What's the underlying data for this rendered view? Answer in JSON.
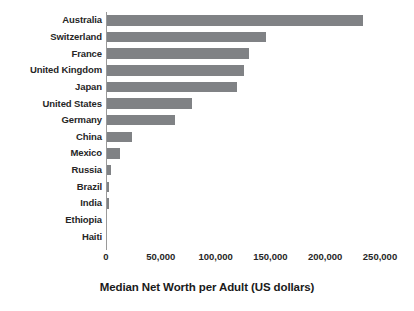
{
  "chart_data": {
    "type": "bar",
    "orientation": "horizontal",
    "title": "",
    "xlabel": "Median Net Worth per Adult (US dollars)",
    "ylabel": "",
    "xlim": [
      0,
      250000
    ],
    "xticks": [
      0,
      50000,
      100000,
      150000,
      200000,
      250000
    ],
    "xtick_labels": [
      "0",
      "50,000",
      "100,000",
      "150,000",
      "200,000",
      "250,000"
    ],
    "grid": false,
    "legend": null,
    "bar_color": "#808285",
    "background_color": "#ffffff",
    "categories": [
      "Australia",
      "Switzerland",
      "France",
      "United Kingdom",
      "Japan",
      "United States",
      "Germany",
      "China",
      "Mexico",
      "Russia",
      "Brazil",
      "India",
      "Ethiopia",
      "Haiti"
    ],
    "values": [
      234500,
      146000,
      130500,
      126000,
      119500,
      78500,
      63000,
      23700,
      12800,
      4500,
      2700,
      2600,
      700,
      250
    ]
  }
}
